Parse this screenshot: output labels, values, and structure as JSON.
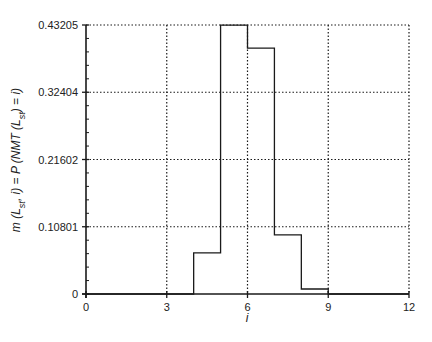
{
  "chart_data": {
    "type": "line",
    "subtype": "step-histogram",
    "title": "",
    "xlabel": "i",
    "ylabel": "m (L_st, i) = P (NMT (L_st) = i)",
    "ylabel_parts": {
      "prefix_m": "m (L",
      "sub1": "st",
      "mid": ", i) = P (NMT (L",
      "sub2": "st",
      "suffix": ") = i)"
    },
    "xlim": [
      0,
      12
    ],
    "ylim": [
      0,
      0.43205
    ],
    "x_ticks": [
      0,
      3,
      6,
      9,
      12
    ],
    "x_tick_labels": [
      "0",
      "3",
      "6",
      "9",
      "12"
    ],
    "y_ticks": [
      0,
      0.10801,
      0.21602,
      0.32404,
      0.43205
    ],
    "y_tick_labels": [
      "0",
      "0.10801",
      "0.21602",
      "0.32404",
      "0.43205"
    ],
    "y_minor_ticks_per_major": 4,
    "grid": true,
    "grid_style": "dotted",
    "legend": null,
    "series": [
      {
        "name": "m(L_st, i)",
        "bins": [
          {
            "i": 0,
            "value": 0
          },
          {
            "i": 1,
            "value": 0
          },
          {
            "i": 2,
            "value": 0
          },
          {
            "i": 3,
            "value": 0
          },
          {
            "i": 4,
            "value": 0.066
          },
          {
            "i": 5,
            "value": 0.432
          },
          {
            "i": 6,
            "value": 0.395
          },
          {
            "i": 7,
            "value": 0.095
          },
          {
            "i": 8,
            "value": 0.008
          },
          {
            "i": 9,
            "value": 0
          },
          {
            "i": 10,
            "value": 0
          },
          {
            "i": 11,
            "value": 0
          }
        ]
      }
    ]
  },
  "colors": {
    "line": "#1a1a1a",
    "grid": "#1a1a1a",
    "axis": "#1a1a1a",
    "background": "#ffffff"
  }
}
